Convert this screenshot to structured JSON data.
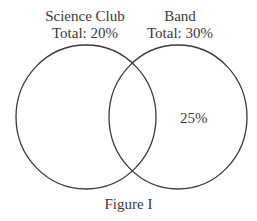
{
  "figure": {
    "caption": "Figure I",
    "sets": [
      {
        "name": "Science Club",
        "total_label": "Total: 20%"
      },
      {
        "name": "Band",
        "total_label": "Total: 30%"
      }
    ],
    "regions": {
      "band_only": "25%"
    },
    "stroke_color": "#3a3a3a"
  }
}
